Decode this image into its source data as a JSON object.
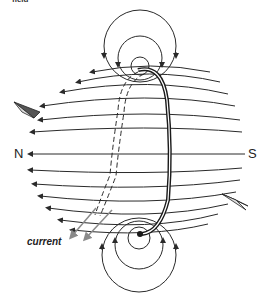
{
  "figure": {
    "top_fragment": "field",
    "labels": {
      "north": "N",
      "south": "S",
      "current": "current"
    },
    "colors": {
      "line": "#2a2a2a",
      "coil": "#1a1a1a",
      "current_arrow": "#8a8a8a",
      "background": "#ffffff"
    },
    "elements": [
      "field-lines",
      "coil-loop",
      "top-circles",
      "bottom-circles",
      "compass-left",
      "compass-right",
      "current-arrows"
    ]
  }
}
